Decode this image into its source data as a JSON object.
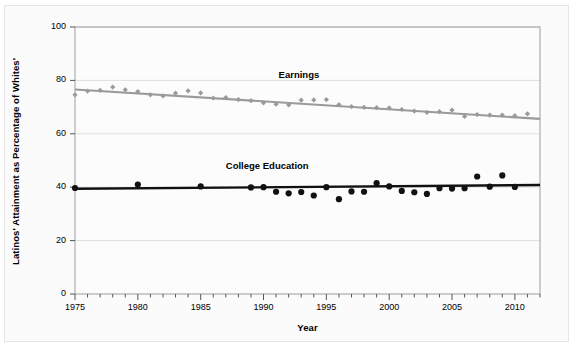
{
  "chart_data": {
    "type": "scatter",
    "title": "",
    "xlabel": "Year",
    "ylabel": "Latinos' Attainment as Percentage of Whites'",
    "xlim": [
      1975,
      2012
    ],
    "ylim": [
      0,
      100
    ],
    "grid": true,
    "legend_position": "inline-annotation",
    "yticks": [
      0,
      20,
      40,
      60,
      80,
      100
    ],
    "ytick_labels": [
      "0",
      "20",
      "40",
      "60",
      "80",
      "100"
    ],
    "xticks": [
      1975,
      1980,
      1985,
      1990,
      1995,
      2000,
      2005,
      2010
    ],
    "xtick_labels": [
      "1975",
      "1980",
      "1985",
      "1990",
      "1995",
      "2000",
      "2005",
      "2010"
    ],
    "x_minor_tick_step": 1,
    "series": [
      {
        "name": "Earnings",
        "color": "#9a9a9a",
        "marker": "diamond",
        "annotation": "Earnings",
        "x": [
          1975,
          1976,
          1977,
          1978,
          1979,
          1980,
          1981,
          1982,
          1983,
          1984,
          1985,
          1986,
          1987,
          1988,
          1989,
          1990,
          1991,
          1992,
          1993,
          1994,
          1995,
          1996,
          1997,
          1998,
          1999,
          2000,
          2001,
          2002,
          2003,
          2004,
          2005,
          2006,
          2007,
          2008,
          2009,
          2010,
          2011
        ],
        "values": [
          74.6,
          76.0,
          76.3,
          77.5,
          76.5,
          75.8,
          74.6,
          74.2,
          75.2,
          76.1,
          75.3,
          73.4,
          73.6,
          72.8,
          72.4,
          71.6,
          71.1,
          70.8,
          72.6,
          72.7,
          72.8,
          70.9,
          70.2,
          69.9,
          69.8,
          69.7,
          69.1,
          68.5,
          68.0,
          68.3,
          68.9,
          66.5,
          67.2,
          67.0,
          67.0,
          66.8,
          67.5
        ],
        "trend": {
          "start_year": 1975,
          "start_value": 76.6,
          "end_year": 2012,
          "end_value": 65.6
        }
      },
      {
        "name": "College Education",
        "color": "#111111",
        "marker": "circle",
        "annotation": "College Education",
        "x": [
          1975,
          1980,
          1985,
          1989,
          1990,
          1991,
          1992,
          1993,
          1994,
          1995,
          1996,
          1997,
          1998,
          1999,
          2000,
          2001,
          2002,
          2003,
          2004,
          2005,
          2006,
          2007,
          2008,
          2009,
          2010
        ],
        "values": [
          39.7,
          41.0,
          40.3,
          39.9,
          40.0,
          38.3,
          37.7,
          38.2,
          36.9,
          40.0,
          35.5,
          38.4,
          38.3,
          41.5,
          40.3,
          38.6,
          38.1,
          37.5,
          39.6,
          39.5,
          39.6,
          44.0,
          40.2,
          44.4,
          40.1
        ],
        "trend": {
          "start_year": 1975,
          "start_value": 39.4,
          "end_year": 2012,
          "end_value": 40.8
        }
      }
    ]
  },
  "labels": {
    "earnings": "Earnings",
    "college": "College Education",
    "xaxis": "Year",
    "yaxis": "Latinos' Attainment as Percentage of Whites'"
  }
}
